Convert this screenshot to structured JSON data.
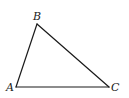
{
  "diagram": {
    "type": "triangle",
    "stroke_color": "#1a1a1a",
    "vertices": [
      {
        "name": "A",
        "label": "A",
        "x": 16,
        "y": 87,
        "label_x": 6,
        "label_y": 91
      },
      {
        "name": "B",
        "label": "B",
        "x": 37,
        "y": 24,
        "label_x": 33,
        "label_y": 20
      },
      {
        "name": "C",
        "label": "C",
        "x": 109,
        "y": 87,
        "label_x": 111,
        "label_y": 91
      }
    ],
    "edges": [
      {
        "from": "A",
        "to": "B"
      },
      {
        "from": "B",
        "to": "C"
      },
      {
        "from": "C",
        "to": "A"
      }
    ]
  }
}
